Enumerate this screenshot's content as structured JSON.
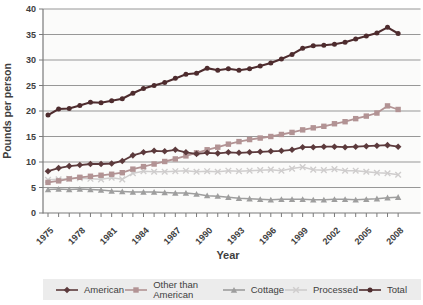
{
  "chart_data": {
    "type": "line",
    "title": "",
    "xlabel": "Year",
    "ylabel": "Pounds per person",
    "ylim": [
      0,
      40
    ],
    "ytick_step": 5,
    "grid": "horizontal gridlines on",
    "legend_position": "bottom strip",
    "x": [
      1975,
      1976,
      1977,
      1978,
      1979,
      1980,
      1981,
      1982,
      1983,
      1984,
      1985,
      1986,
      1987,
      1988,
      1989,
      1990,
      1991,
      1992,
      1993,
      1994,
      1995,
      1996,
      1997,
      1998,
      1999,
      2000,
      2001,
      2002,
      2003,
      2004,
      2005,
      2006,
      2007,
      2008
    ],
    "xtick_labels": [
      "1975",
      "1978",
      "1981",
      "1984",
      "1987",
      "1990",
      "1993",
      "1996",
      "1999",
      "2002",
      "2005",
      "2008"
    ],
    "series": [
      {
        "name": "American",
        "marker": "diamond",
        "color": "#5c3a3c",
        "values": [
          8.2,
          8.8,
          9.2,
          9.4,
          9.6,
          9.6,
          9.7,
          10.2,
          11.3,
          11.9,
          12.2,
          12.1,
          12.4,
          11.9,
          11.6,
          11.8,
          11.7,
          11.9,
          11.8,
          11.9,
          12.0,
          12.1,
          12.2,
          12.4,
          12.9,
          12.9,
          13.0,
          13.0,
          12.9,
          13.0,
          13.1,
          13.2,
          13.3,
          13.0
        ]
      },
      {
        "name": "Other than American",
        "marker": "square",
        "color": "#b29394",
        "values": [
          6.0,
          6.3,
          6.7,
          7.0,
          7.2,
          7.4,
          7.6,
          7.9,
          8.6,
          9.1,
          9.6,
          10.1,
          10.6,
          11.2,
          11.8,
          12.4,
          12.9,
          13.5,
          14.0,
          14.4,
          14.7,
          15.0,
          15.4,
          15.8,
          16.3,
          16.7,
          17.0,
          17.5,
          17.9,
          18.5,
          19.0,
          19.6,
          21.0,
          20.3
        ]
      },
      {
        "name": "Cottage",
        "marker": "triangle",
        "color": "#9e9e9e",
        "values": [
          4.6,
          4.7,
          4.6,
          4.7,
          4.6,
          4.5,
          4.3,
          4.2,
          4.1,
          4.1,
          4.1,
          4.0,
          3.9,
          3.9,
          3.7,
          3.4,
          3.3,
          3.1,
          2.9,
          2.8,
          2.7,
          2.6,
          2.7,
          2.7,
          2.7,
          2.6,
          2.6,
          2.7,
          2.7,
          2.6,
          2.7,
          2.8,
          3.0,
          3.1
        ]
      },
      {
        "name": "Processed",
        "marker": "x",
        "color": "#cfcdcd",
        "values": [
          6.5,
          6.6,
          6.7,
          6.8,
          6.7,
          6.6,
          6.9,
          6.6,
          7.8,
          8.2,
          8.1,
          8.1,
          8.2,
          8.3,
          8.1,
          8.2,
          8.1,
          8.3,
          8.2,
          8.3,
          8.4,
          8.5,
          8.3,
          8.7,
          9.0,
          8.5,
          8.4,
          8.6,
          8.3,
          8.3,
          8.1,
          7.9,
          7.8,
          7.5
        ]
      },
      {
        "name": "Total",
        "marker": "circle",
        "color": "#4e2c2e",
        "values": [
          19.2,
          20.4,
          20.5,
          21.1,
          21.7,
          21.6,
          22.0,
          22.4,
          23.5,
          24.4,
          25.0,
          25.6,
          26.4,
          27.2,
          27.4,
          28.4,
          28.0,
          28.3,
          28.0,
          28.3,
          28.8,
          29.4,
          30.2,
          31.1,
          32.3,
          32.8,
          32.9,
          33.1,
          33.5,
          34.1,
          34.7,
          35.3,
          36.4,
          35.2
        ]
      }
    ],
    "colors": {
      "gridline": "#979797",
      "axis": "#7a7a7a",
      "tick_text": "#3e3e3e",
      "legend_bg": "#ececec",
      "plot_bg": "#fbfbfa"
    }
  }
}
